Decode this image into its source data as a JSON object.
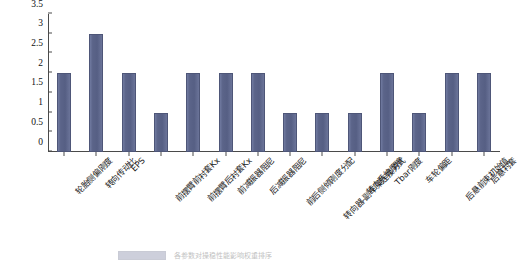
{
  "chart_data": {
    "type": "bar",
    "title": "",
    "subtitle": "",
    "xlabel": "",
    "ylabel": "",
    "ylim": [
      0,
      3.5
    ],
    "grid": false,
    "legend_position": "bottom",
    "y_ticks": [
      "0",
      "0.5",
      "1",
      "1.5",
      "2",
      "2.5",
      "3",
      "3.5"
    ],
    "y_tick_values": [
      0,
      0.5,
      1,
      1.5,
      2,
      2.5,
      3,
      3.5
    ],
    "categories": [
      "轮胎侧偏刚度",
      "转向传动比",
      "EPS",
      "前摆臂前衬套Kx",
      "前摆臂后衬套Kx",
      "前减振器阻尼",
      "后减振器阻尼",
      "前后侧倾刚度分配",
      "转向器-副车架连接方式",
      "转向系统摩擦",
      "Tbar刚度",
      "车轮偏距",
      "后悬前束初始值",
      "后悬衬套"
    ],
    "values": [
      2,
      3,
      2,
      1,
      2,
      2,
      2,
      1,
      1,
      1,
      2,
      1,
      2,
      2
    ],
    "series": [
      {
        "name": "",
        "values": [
          2,
          3,
          2,
          1,
          2,
          2,
          2,
          1,
          1,
          1,
          2,
          1,
          2,
          2
        ],
        "color": "#5b6489"
      }
    ]
  },
  "caption": {
    "text": "各参数对操稳性能影响权重排序",
    "legend_label": ""
  },
  "colors": {
    "bar": "#5b6489",
    "axis": "#4a4a4a",
    "background": "#ffffff",
    "text": "#1a1a1a"
  }
}
